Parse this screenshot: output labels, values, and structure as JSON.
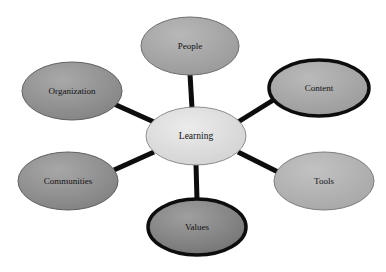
{
  "diagram": {
    "type": "hub-and-spoke-concept-map",
    "title_visible": false,
    "background_color": "#ffffff",
    "connector_color": "#0d0d0d",
    "connector_width_px": 5,
    "center": {
      "id": "learning",
      "label": "Learning",
      "cx": 196,
      "cy": 136,
      "rx": 50,
      "ry": 29,
      "fill": "#d3d3d3",
      "stroke": "#8c8c8c",
      "stroke_width": 1,
      "font_size": 9.5
    },
    "nodes": [
      {
        "id": "people",
        "label": "People",
        "cx": 190,
        "cy": 46,
        "rx": 49,
        "ry": 29,
        "fill": "#9a9a9a",
        "stroke": "#6e6e6e",
        "stroke_width": 1,
        "font_size": 9,
        "position": "top"
      },
      {
        "id": "content",
        "label": "Content",
        "cx": 319,
        "cy": 88,
        "rx": 50,
        "ry": 28,
        "fill": "#9c9c9c",
        "stroke": "#0d0d0d",
        "stroke_width": 3.5,
        "font_size": 9,
        "position": "upper-right"
      },
      {
        "id": "tools",
        "label": "Tools",
        "cx": 324,
        "cy": 181,
        "rx": 50,
        "ry": 29,
        "fill": "#a8a8a8",
        "stroke": "#7d7d7d",
        "stroke_width": 1,
        "font_size": 9,
        "position": "lower-right"
      },
      {
        "id": "values",
        "label": "Values",
        "cx": 197,
        "cy": 227,
        "rx": 49,
        "ry": 28,
        "fill": "#767676",
        "stroke": "#0d0d0d",
        "stroke_width": 3.5,
        "font_size": 9,
        "position": "bottom"
      },
      {
        "id": "communities",
        "label": "Communities",
        "cx": 68,
        "cy": 181,
        "rx": 50,
        "ry": 29,
        "fill": "#828282",
        "stroke": "#5f5f5f",
        "stroke_width": 1,
        "font_size": 9,
        "position": "lower-left"
      },
      {
        "id": "organization",
        "label": "Organization",
        "cx": 72,
        "cy": 91,
        "rx": 50,
        "ry": 29,
        "fill": "#848484",
        "stroke": "#5f5f5f",
        "stroke_width": 1,
        "font_size": 9,
        "position": "upper-left"
      }
    ],
    "connectors": [
      {
        "id": "learning-people",
        "from": "learning",
        "to": "people",
        "x1": 192,
        "y1": 108,
        "x2": 190,
        "y2": 74
      },
      {
        "id": "learning-content",
        "from": "learning",
        "to": "content",
        "x1": 238,
        "y1": 122,
        "x2": 275,
        "y2": 99
      },
      {
        "id": "learning-tools",
        "from": "learning",
        "to": "tools",
        "x1": 238,
        "y1": 152,
        "x2": 278,
        "y2": 172
      },
      {
        "id": "learning-values",
        "from": "learning",
        "to": "values",
        "x1": 196,
        "y1": 164,
        "x2": 197,
        "y2": 200
      },
      {
        "id": "learning-communities",
        "from": "learning",
        "to": "communities",
        "x1": 154,
        "y1": 152,
        "x2": 114,
        "y2": 170
      },
      {
        "id": "learning-organization",
        "from": "learning",
        "to": "organization",
        "x1": 154,
        "y1": 122,
        "x2": 114,
        "y2": 104
      }
    ]
  }
}
